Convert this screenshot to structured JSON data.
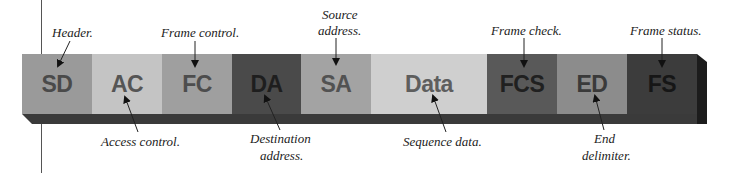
{
  "segments": [
    {
      "abbr": "SD",
      "bg": "#9a9a9a",
      "fg": "#4a4a4a",
      "shadow": "#555555"
    },
    {
      "abbr": "AC",
      "bg": "#c4c4c4",
      "fg": "#555555",
      "shadow": "#666666"
    },
    {
      "abbr": "FC",
      "bg": "#9f9f9f",
      "fg": "#4d4d4d",
      "shadow": "#555555"
    },
    {
      "abbr": "DA",
      "bg": "#4a4a4a",
      "fg": "#1e1e1e",
      "shadow": "#2b2b2b"
    },
    {
      "abbr": "SA",
      "bg": "#a3a3a3",
      "fg": "#525252",
      "shadow": "#5a5a5a"
    },
    {
      "abbr": "Data",
      "bg": "#cfcfcf",
      "fg": "#5e5e5e",
      "shadow": "#6e6e6e"
    },
    {
      "abbr": "FCS",
      "bg": "#595959",
      "fg": "#202020",
      "shadow": "#333333"
    },
    {
      "abbr": "ED",
      "bg": "#8c8c8c",
      "fg": "#3a3a3a",
      "shadow": "#4a4a4a"
    },
    {
      "abbr": "FS",
      "bg": "#3c3c3c",
      "fg": "#161616",
      "shadow": "#262626"
    }
  ],
  "labels_top": {
    "header": "Header.",
    "frame_control": "Frame control.",
    "source_address_1": "Source",
    "source_address_2": "address.",
    "frame_check": "Frame check.",
    "frame_status": "Frame status."
  },
  "labels_bottom": {
    "access_control": "Access control.",
    "destination_address_1": "Destination",
    "destination_address_2": "address.",
    "sequence_data": "Sequence data.",
    "end_delimiter_1": "End",
    "end_delimiter_2": "delimiter."
  }
}
